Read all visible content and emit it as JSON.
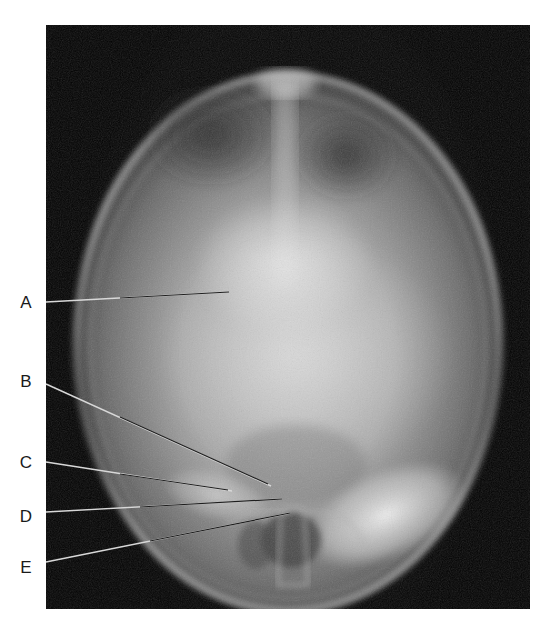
{
  "figure": {
    "type": "radiograph",
    "view": "skull x-ray (towne / AP axial view)",
    "labels": [
      {
        "letter": "A",
        "x": 26,
        "y": 303,
        "line_start": [
          46,
          302
        ],
        "line_end": [
          229,
          292
        ]
      },
      {
        "letter": "B",
        "x": 26,
        "y": 382,
        "line_start": [
          46,
          384
        ],
        "line_end": [
          271,
          486
        ]
      },
      {
        "letter": "C",
        "x": 26,
        "y": 463,
        "line_start": [
          46,
          462
        ],
        "line_end": [
          232,
          491
        ]
      },
      {
        "letter": "D",
        "x": 26,
        "y": 517,
        "line_start": [
          46,
          512
        ],
        "line_end": [
          282,
          499
        ]
      },
      {
        "letter": "E",
        "x": 26,
        "y": 568,
        "line_start": [
          46,
          562
        ],
        "line_end": [
          290,
          513
        ]
      }
    ],
    "colors": {
      "background": "#ffffff",
      "film": "#050505",
      "label_text": "#1a1a1a",
      "leader_line_dark": "#1e1e1e",
      "leader_line_light": "#d8d8d8"
    }
  }
}
